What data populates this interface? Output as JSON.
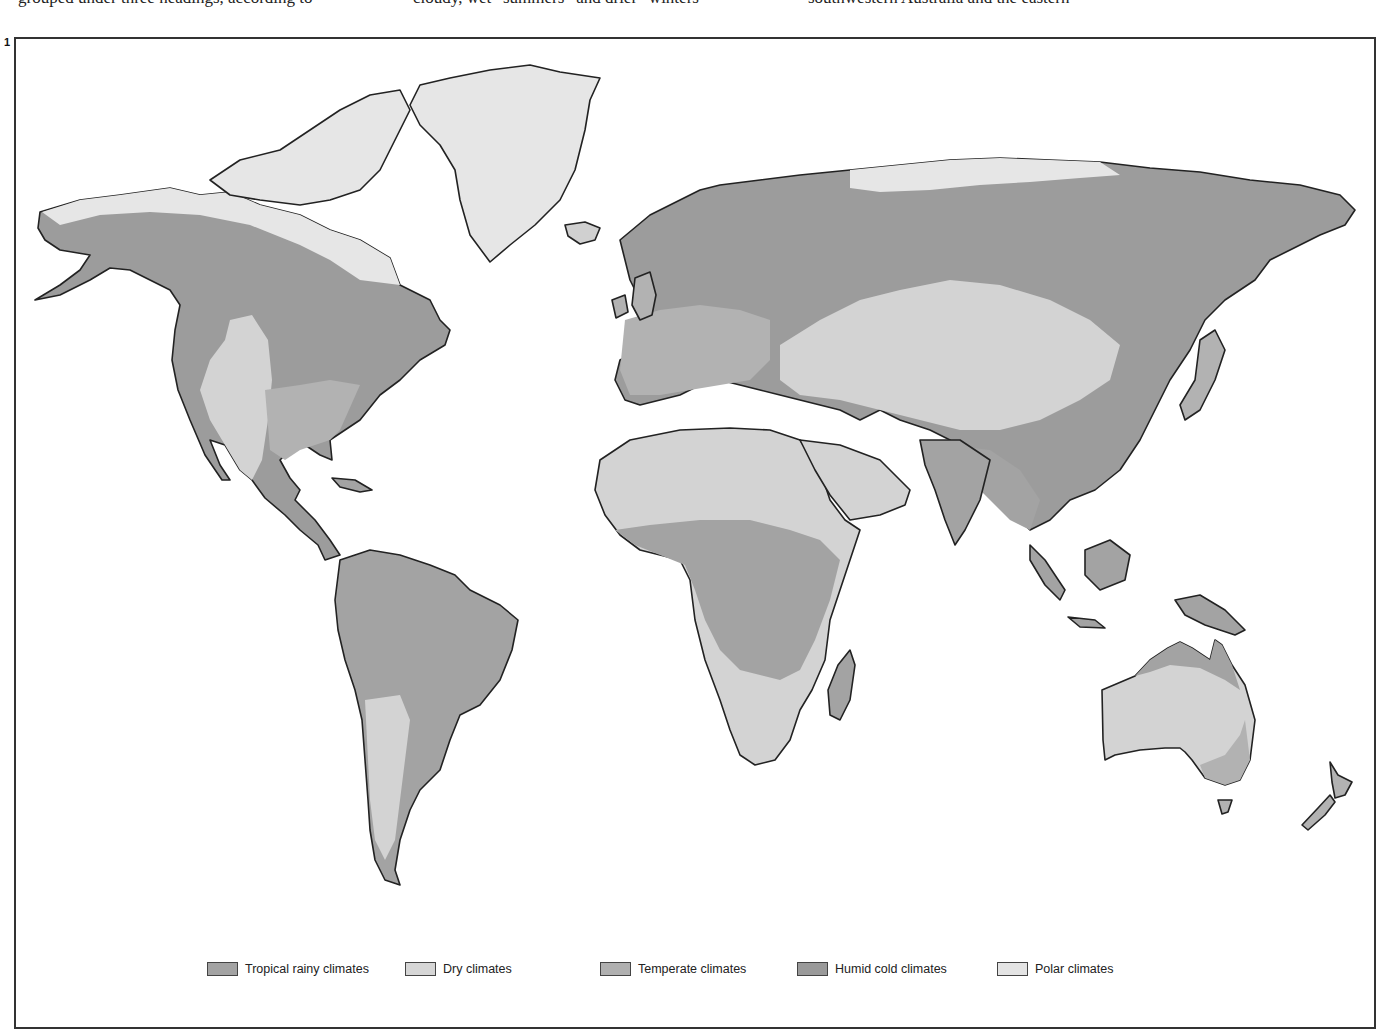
{
  "page_text": {
    "col1": "grouped under three headings, according to",
    "col2": "cloudy, wet “summers” and drier “winters”",
    "col3": "southwestern   Australia   and   the   eastern"
  },
  "figure": {
    "number": "1"
  },
  "colors": {
    "tropical": "#a3a3a3",
    "dry": "#d3d3d3",
    "temperate": "#b2b2b2",
    "humid_cold": "#9c9c9c",
    "polar": "#e6e6e6",
    "outline": "#222222",
    "ocean": "#ffffff"
  },
  "legend": [
    {
      "key": "tropical",
      "label": "Tropical rainy climates",
      "color": "#a3a3a3"
    },
    {
      "key": "dry",
      "label": "Dry climates",
      "color": "#d6d6d6"
    },
    {
      "key": "temperate",
      "label": "Temperate climates",
      "color": "#b0b0b0"
    },
    {
      "key": "humid_cold",
      "label": "Humid cold climates",
      "color": "#9a9a9a"
    },
    {
      "key": "polar",
      "label": "Polar climates",
      "color": "#e4e4e4"
    }
  ],
  "regions": [
    {
      "name": "North America",
      "dominant": "Humid cold climates"
    },
    {
      "name": "Greenland",
      "dominant": "Polar climates"
    },
    {
      "name": "South America",
      "dominant": "Tropical rainy climates"
    },
    {
      "name": "Europe",
      "dominant": "Temperate climates"
    },
    {
      "name": "Africa",
      "dominant": "Dry climates / Tropical rainy climates"
    },
    {
      "name": "Asia",
      "dominant": "Humid cold climates"
    },
    {
      "name": "Australia",
      "dominant": "Dry climates"
    },
    {
      "name": "New Zealand",
      "dominant": "Temperate climates"
    }
  ]
}
